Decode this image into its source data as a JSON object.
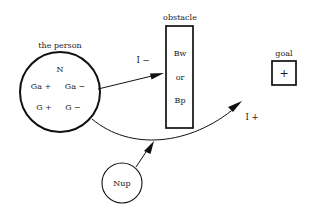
{
  "diagram": {
    "title_visible": false,
    "background_color": "#ffffff",
    "ink_color": "#111111",
    "nodes": {
      "person": {
        "caption": "the person",
        "shape": "circle",
        "contents": {
          "top": "N",
          "row1_left": "Ga +",
          "row1_right": "Ga −",
          "row2_left": "G +",
          "row2_right": "G −"
        }
      },
      "obstacle": {
        "caption": "obstacle",
        "shape": "rectangle",
        "contents": {
          "line1": "Bw",
          "line2": "or",
          "line3": "Bp"
        }
      },
      "goal": {
        "caption": "goal",
        "shape": "rectangle",
        "contents": {
          "line1": "+"
        }
      },
      "nup": {
        "caption": "",
        "shape": "circle",
        "contents": {
          "line1": "Nup"
        }
      }
    },
    "edges": {
      "person_to_obstacle": {
        "label": "I −",
        "style": "straight-arrow"
      },
      "person_to_goal": {
        "label": "I +",
        "style": "curved-arrow"
      },
      "nup_to_path": {
        "label": "",
        "style": "straight-arrow"
      }
    }
  }
}
